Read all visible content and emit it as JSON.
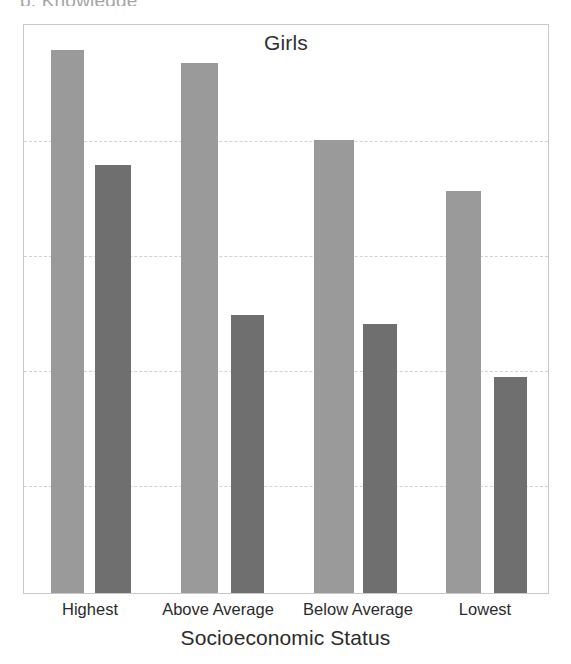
{
  "figure": {
    "clipped_header_fragment": "p, Knowledge",
    "series_title": "Girls",
    "axis_title": "Socioeconomic Status"
  },
  "colors": {
    "bar_light": "#9a9a9a",
    "bar_dark": "#6f6f6f",
    "gridline": "#d2d2d2",
    "frame": "#c9c9c9",
    "text": "#2b2b2b"
  },
  "chart_data": {
    "type": "bar",
    "title": "Girls",
    "xlabel": "Socioeconomic Status",
    "ylabel": "",
    "grid": true,
    "legend_position": "none",
    "ylim": [
      0,
      4.96
    ],
    "gridline_values": [
      1,
      2,
      3,
      4
    ],
    "categories": [
      "Highest",
      "Above Average",
      "Below Average",
      "Lowest"
    ],
    "series": [
      {
        "name": "light-bar",
        "color": "#9a9a9a",
        "values": [
          4.72,
          4.61,
          3.94,
          3.5
        ]
      },
      {
        "name": "dark-bar",
        "color": "#6f6f6f",
        "values": [
          3.72,
          2.42,
          2.34,
          1.88
        ]
      }
    ]
  },
  "geometry": {
    "plot": {
      "x": 23,
      "y": 24,
      "w": 526,
      "h": 570
    },
    "baseline_y": 594,
    "gridlines_y": [
      140,
      255,
      370,
      485
    ],
    "bars": [
      {
        "group": 0,
        "series": 0,
        "x": 50,
        "w": 33,
        "top": 51
      },
      {
        "group": 0,
        "series": 1,
        "x": 94,
        "w": 36,
        "top": 166
      },
      {
        "group": 1,
        "series": 0,
        "x": 180,
        "w": 37,
        "top": 64
      },
      {
        "group": 1,
        "series": 1,
        "x": 230,
        "w": 33,
        "top": 316
      },
      {
        "group": 2,
        "series": 0,
        "x": 313,
        "w": 40,
        "top": 141
      },
      {
        "group": 2,
        "series": 1,
        "x": 362,
        "w": 34,
        "top": 325
      },
      {
        "group": 3,
        "series": 0,
        "x": 445,
        "w": 35,
        "top": 192
      },
      {
        "group": 3,
        "series": 1,
        "x": 493,
        "w": 33,
        "top": 378
      }
    ],
    "tick_x": [
      90,
      218,
      358,
      485
    ]
  }
}
